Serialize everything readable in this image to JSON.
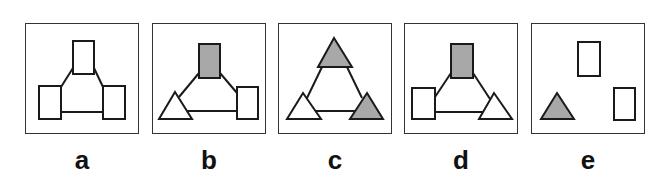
{
  "colors": {
    "stroke": "#1a1a1a",
    "border": "#333333",
    "shaded": "#a8a8a8",
    "empty": "#ffffff"
  },
  "options": [
    {
      "label": "a",
      "left": 25,
      "shapes": [
        {
          "type": "rect",
          "fill": "empty",
          "x": 48,
          "y": 18,
          "w": 21,
          "h": 33
        },
        {
          "type": "rect",
          "fill": "empty",
          "x": 14,
          "y": 63,
          "w": 22,
          "h": 33
        },
        {
          "type": "rect",
          "fill": "empty",
          "x": 78,
          "y": 63,
          "w": 22,
          "h": 33
        }
      ],
      "lines": [
        [
          48,
          45,
          36,
          64
        ],
        [
          69,
          45,
          78,
          64
        ],
        [
          36,
          89,
          78,
          89
        ]
      ]
    },
    {
      "label": "b",
      "left": 152,
      "shapes": [
        {
          "type": "rect",
          "fill": "shaded",
          "x": 47,
          "y": 21,
          "w": 21,
          "h": 34
        },
        {
          "type": "triangle",
          "fill": "empty",
          "apex": [
            23,
            69
          ],
          "base": [
            7,
            40,
            96
          ]
        },
        {
          "type": "rect",
          "fill": "empty",
          "x": 85,
          "y": 64,
          "w": 21,
          "h": 32
        }
      ],
      "lines": [
        [
          47,
          50,
          27,
          74
        ],
        [
          68,
          50,
          85,
          70
        ],
        [
          33,
          88,
          85,
          88
        ]
      ]
    },
    {
      "label": "c",
      "left": 278,
      "shapes": [
        {
          "type": "triangle",
          "fill": "shaded",
          "apex": [
            56,
            15
          ],
          "base": [
            40,
            74,
            44
          ]
        },
        {
          "type": "triangle",
          "fill": "empty",
          "apex": [
            25,
            70
          ],
          "base": [
            9,
            43,
            96
          ]
        },
        {
          "type": "triangle",
          "fill": "shaded",
          "apex": [
            89,
            70
          ],
          "base": [
            72,
            105,
            96
          ]
        }
      ],
      "lines": [
        [
          44,
          44,
          29,
          75
        ],
        [
          69,
          44,
          84,
          75
        ],
        [
          35,
          88,
          79,
          88
        ]
      ]
    },
    {
      "label": "d",
      "left": 404,
      "shapes": [
        {
          "type": "rect",
          "fill": "shaded",
          "x": 47,
          "y": 21,
          "w": 22,
          "h": 34
        },
        {
          "type": "rect",
          "fill": "empty",
          "x": 8,
          "y": 65,
          "w": 23,
          "h": 31
        },
        {
          "type": "triangle",
          "fill": "empty",
          "apex": [
            90,
            70
          ],
          "base": [
            75,
            108,
            96
          ]
        }
      ],
      "lines": [
        [
          47,
          50,
          31,
          74
        ],
        [
          69,
          50,
          86,
          76
        ],
        [
          31,
          89,
          82,
          89
        ]
      ]
    },
    {
      "label": "e",
      "left": 531,
      "shapes": [
        {
          "type": "rect",
          "fill": "empty",
          "x": 47,
          "y": 19,
          "w": 22,
          "h": 34
        },
        {
          "type": "rect",
          "fill": "empty",
          "x": 83,
          "y": 65,
          "w": 21,
          "h": 32
        },
        {
          "type": "triangle",
          "fill": "shaded",
          "apex": [
            26,
            70
          ],
          "base": [
            10,
            43,
            96
          ]
        }
      ],
      "lines": []
    }
  ]
}
